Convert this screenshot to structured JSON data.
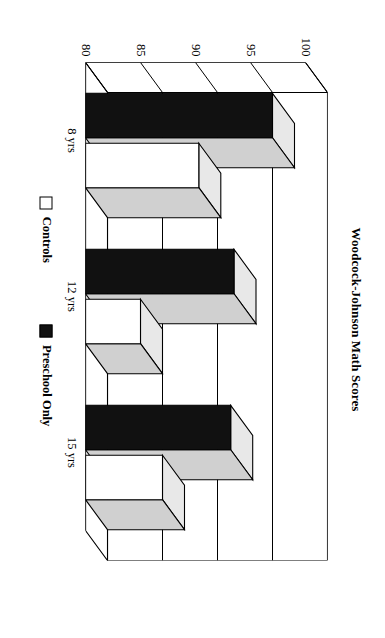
{
  "chart_data": {
    "type": "bar",
    "orientation": "horizontal-3d",
    "title": "Woodcock-Johnson Math Scores",
    "xlabel": "",
    "ylabel": "",
    "categories": [
      "8 yrs",
      "12 yrs",
      "15 yrs"
    ],
    "series": [
      {
        "name": "Controls",
        "values": [
          90.3,
          85.0,
          87.0
        ],
        "color": "#ffffff"
      },
      {
        "name": "Preschool Only",
        "values": [
          97.0,
          93.5,
          93.2
        ],
        "color": "#111111"
      }
    ],
    "ylim": [
      80,
      100
    ],
    "yticks": [
      100,
      95,
      90,
      85,
      80
    ],
    "ytick_labels": [
      "100",
      "95",
      "90",
      "85",
      "80"
    ],
    "grid": true,
    "legend_position": "bottom",
    "legend_entries": [
      {
        "label": "Controls",
        "swatch": "white-square"
      },
      {
        "label": "Preschool Only",
        "swatch": "black-square"
      }
    ]
  },
  "figure": {
    "title": "Woodcock-Johnson Math Scores",
    "background_color": "#ffffff",
    "line_color": "#000000",
    "bar_black": "#111111",
    "bar_white": "#ffffff",
    "bar_top_shade": "#e8e8e8",
    "bar_side_shade": "#d0d0d0"
  },
  "axis": {
    "ticks": [
      "100",
      "95",
      "90",
      "85",
      "80"
    ]
  },
  "categories": {
    "c0": "8 yrs",
    "c1": "12 yrs",
    "c2": "15 yrs"
  },
  "legend": {
    "controls_label": "Controls",
    "preschool_label": "Preschool Only"
  }
}
